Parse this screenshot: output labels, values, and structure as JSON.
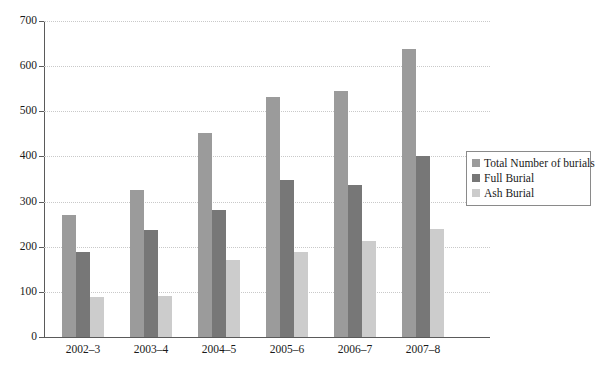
{
  "chart_data": {
    "type": "bar",
    "title": "",
    "subtitle": "",
    "xlabel": "",
    "ylabel": "",
    "ylim": [
      0,
      700
    ],
    "ytick_step": 100,
    "yticks": [
      0,
      100,
      200,
      300,
      400,
      500,
      600,
      700
    ],
    "grid": true,
    "grid_style": "dotted-horizontal",
    "legend_position": "right",
    "categories": [
      "2002–3",
      "2003–4",
      "2004–5",
      "2005–6",
      "2006–7",
      "2007–8"
    ],
    "series": [
      {
        "name": "Total Number of burials",
        "color": "#9b9b9b",
        "values": [
          270,
          325,
          452,
          532,
          546,
          637
        ]
      },
      {
        "name": "Full Burial",
        "color": "#777777",
        "values": [
          188,
          236,
          282,
          347,
          337,
          402
        ]
      },
      {
        "name": "Ash Burial",
        "color": "#cccccc",
        "values": [
          88,
          90,
          170,
          188,
          212,
          240
        ]
      }
    ]
  },
  "legend": {
    "items": [
      {
        "label": "Total Number of burials",
        "color": "#9b9b9b"
      },
      {
        "label": "Full Burial",
        "color": "#777777"
      },
      {
        "label": "Ash Burial",
        "color": "#cccccc"
      }
    ]
  }
}
